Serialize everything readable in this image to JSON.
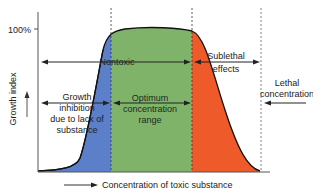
{
  "diagram": {
    "type": "tolerance-curve",
    "y_axis": {
      "label": "Growth index",
      "tick_label": "100%"
    },
    "x_axis": {
      "label": "Concentration of toxic substance"
    },
    "zones": [
      {
        "id": "inhibition",
        "label_lines": [
          "Growth",
          "inhibition",
          "due to lack of",
          "substance"
        ],
        "color": "#5b7fc8"
      },
      {
        "id": "optimum",
        "label_lines": [
          "Optimum",
          "concentration",
          "range"
        ],
        "color": "#7fb36a"
      },
      {
        "id": "sublethal",
        "label_lines": [
          "Sublethal",
          "effects"
        ],
        "color": "#ee5a2a"
      }
    ],
    "ranges": {
      "nontoxic": "Nontoxic",
      "lethal_lines": [
        "Lethal",
        "concentration"
      ]
    }
  }
}
